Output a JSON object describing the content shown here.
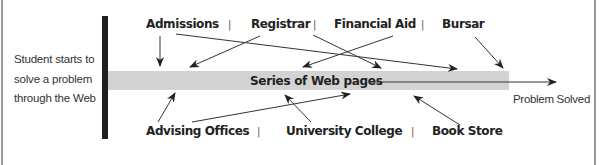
{
  "diagram": {
    "start_text": [
      "Student starts to",
      "solve a problem",
      "through the Web"
    ],
    "center_label": "Series of Web pages",
    "end_label": "Problem Solved",
    "top_sources": [
      {
        "label": "Admissions"
      },
      {
        "label": "Registrar"
      },
      {
        "label": "Financial Aid"
      },
      {
        "label": "Bursar"
      }
    ],
    "bottom_sources": [
      {
        "label": "Advising Offices"
      },
      {
        "label": "University College"
      },
      {
        "label": "Book Store"
      }
    ],
    "separator": "|",
    "colors": {
      "band": "#d3d3d3",
      "bar": "#1f1f1f",
      "text": "#222222",
      "frame": "#9a9a9a"
    }
  }
}
